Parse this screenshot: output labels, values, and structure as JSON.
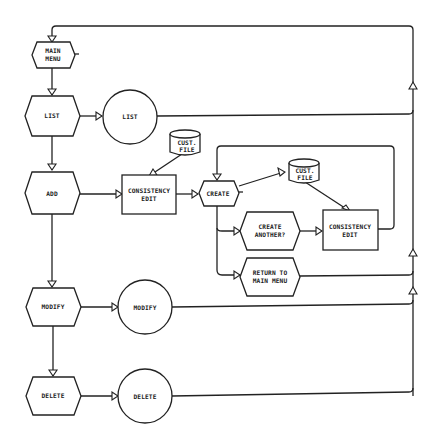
{
  "diagram": {
    "colors": {
      "stroke": "#222222",
      "background": "#ffffff"
    },
    "nodes": {
      "main_menu": {
        "shape": "hexagon",
        "lines": [
          "MAIN",
          "MENU"
        ]
      },
      "list_option": {
        "shape": "hexagon",
        "lines": [
          "LIST"
        ]
      },
      "list_process": {
        "shape": "circle",
        "lines": [
          "LIST"
        ]
      },
      "add_option": {
        "shape": "hexagon",
        "lines": [
          "ADD"
        ]
      },
      "cust_file_1": {
        "shape": "cylinder",
        "lines": [
          "CUST.",
          "FILE"
        ]
      },
      "consistency_edit_1": {
        "shape": "rectangle",
        "lines": [
          "CONSISTENCY",
          "EDIT"
        ]
      },
      "create": {
        "shape": "hexagon",
        "lines": [
          "CREATE"
        ]
      },
      "cust_file_2": {
        "shape": "cylinder",
        "lines": [
          "CUST.",
          "FILE"
        ]
      },
      "create_another": {
        "shape": "hexagon",
        "lines": [
          "CREATE",
          "ANOTHER?"
        ]
      },
      "consistency_edit_2": {
        "shape": "rectangle",
        "lines": [
          "CONSISTENCY",
          "EDIT"
        ]
      },
      "return_main_menu": {
        "shape": "hexagon",
        "lines": [
          "RETURN TO",
          "MAIN MENU"
        ]
      },
      "modify_option": {
        "shape": "hexagon",
        "lines": [
          "MODIFY"
        ]
      },
      "modify_process": {
        "shape": "circle",
        "lines": [
          "MODIFY"
        ]
      },
      "delete_option": {
        "shape": "hexagon",
        "lines": [
          "DELETE"
        ]
      },
      "delete_process": {
        "shape": "circle",
        "lines": [
          "DELETE"
        ]
      }
    },
    "edges": [
      [
        "main_menu",
        "list_option"
      ],
      [
        "list_option",
        "list_process"
      ],
      [
        "list_option",
        "add_option"
      ],
      [
        "add_option",
        "consistency_edit_1"
      ],
      [
        "cust_file_1",
        "consistency_edit_1"
      ],
      [
        "consistency_edit_1",
        "create"
      ],
      [
        "create",
        "cust_file_2"
      ],
      [
        "cust_file_2",
        "consistency_edit_2"
      ],
      [
        "create",
        "create_another"
      ],
      [
        "create_another",
        "consistency_edit_2"
      ],
      [
        "consistency_edit_2",
        "create"
      ],
      [
        "create",
        "return_main_menu"
      ],
      [
        "add_option",
        "modify_option"
      ],
      [
        "modify_option",
        "modify_process"
      ],
      [
        "modify_option",
        "delete_option"
      ],
      [
        "delete_option",
        "delete_process"
      ],
      [
        "list_process",
        "main_menu"
      ],
      [
        "return_main_menu",
        "main_menu"
      ],
      [
        "modify_process",
        "main_menu"
      ],
      [
        "delete_process",
        "main_menu"
      ]
    ]
  }
}
